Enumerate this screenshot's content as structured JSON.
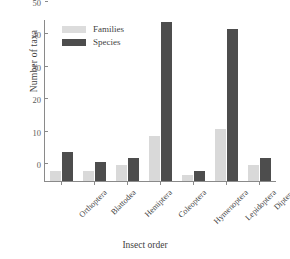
{
  "chart_data": {
    "type": "bar",
    "title": "",
    "xlabel": "Insect order",
    "ylabel": "Number of taxa",
    "ylim": [
      0,
      50
    ],
    "yticks": [
      0,
      10,
      20,
      30,
      40,
      50
    ],
    "grid": false,
    "legend_position": "upper-left-inside",
    "categories": [
      "Orthoptera",
      "Blattodea",
      "Hemiptera",
      "Coleoptera",
      "Hymenoptera",
      "Lepidoptera",
      "Diptera"
    ],
    "series": [
      {
        "name": "Families",
        "color": "#d9d9d9",
        "values": [
          3,
          3,
          5,
          14,
          2,
          16,
          5
        ]
      },
      {
        "name": "Species",
        "color": "#4d4d4d",
        "values": [
          9,
          6,
          7,
          49,
          3,
          47,
          7
        ]
      }
    ]
  }
}
